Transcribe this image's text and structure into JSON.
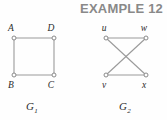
{
  "heading": {
    "text": "EXAMPLE 12",
    "color": "#898989"
  },
  "figure": {
    "background_color": "#fefefe",
    "edge_color": "#9a9a9a",
    "vertex_stroke_color": "#8a8a8a",
    "vertex_fill_color": "#ffffff",
    "label_color": "#2b2b2b"
  },
  "graphs": [
    {
      "name": "G1",
      "caption": "G",
      "caption_subscript": "1",
      "vertices": [
        {
          "id": "A",
          "label": "A",
          "x": 14,
          "y": 38,
          "label_x": 11,
          "label_y": 31
        },
        {
          "id": "D",
          "label": "D",
          "x": 54,
          "y": 38,
          "label_x": 51,
          "label_y": 31
        },
        {
          "id": "B",
          "label": "B",
          "x": 14,
          "y": 75,
          "label_x": 11,
          "label_y": 88
        },
        {
          "id": "C",
          "label": "C",
          "x": 54,
          "y": 75,
          "label_x": 51,
          "label_y": 88
        }
      ],
      "edges": [
        {
          "from": "A",
          "to": "D"
        },
        {
          "from": "A",
          "to": "B"
        },
        {
          "from": "B",
          "to": "C"
        },
        {
          "from": "D",
          "to": "C"
        }
      ],
      "caption_x": 30,
      "caption_y": 110
    },
    {
      "name": "G2",
      "caption": "G",
      "caption_subscript": "2",
      "vertices": [
        {
          "id": "u",
          "label": "u",
          "x": 106,
          "y": 38,
          "label_x": 103,
          "label_y": 31
        },
        {
          "id": "w",
          "label": "w",
          "x": 146,
          "y": 38,
          "label_x": 142,
          "label_y": 31
        },
        {
          "id": "v",
          "label": "v",
          "x": 106,
          "y": 75,
          "label_x": 103,
          "label_y": 88
        },
        {
          "id": "x",
          "label": "x",
          "x": 146,
          "y": 75,
          "label_x": 143,
          "label_y": 88
        }
      ],
      "edges": [
        {
          "from": "u",
          "to": "w"
        },
        {
          "from": "v",
          "to": "x"
        },
        {
          "from": "u",
          "to": "x"
        },
        {
          "from": "w",
          "to": "v"
        }
      ],
      "caption_x": 123,
      "caption_y": 110
    }
  ]
}
